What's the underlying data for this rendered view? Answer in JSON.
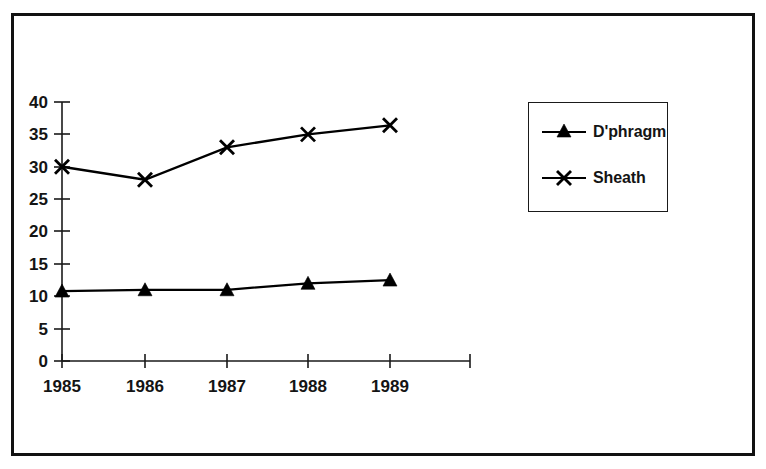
{
  "chart_data": {
    "type": "line",
    "title": "",
    "subtitle": "",
    "xlabel": "",
    "ylabel": "",
    "categories": [
      "1985",
      "1986",
      "1987",
      "1988",
      "1989"
    ],
    "x_tick_labels": [
      "1985",
      "1986",
      "1987",
      "1988",
      "1989"
    ],
    "y_tick_labels": [
      "0",
      "5",
      "10",
      "15",
      "20",
      "25",
      "30",
      "35",
      "40"
    ],
    "y_ticks": [
      0,
      5,
      10,
      15,
      20,
      25,
      30,
      35,
      40
    ],
    "ylim": [
      0,
      40
    ],
    "grid": false,
    "legend_position": "right",
    "series": [
      {
        "name": "D'phragm",
        "marker": "triangle",
        "color": "#000000",
        "values": [
          10.8,
          11.0,
          11.0,
          12.0,
          12.5
        ]
      },
      {
        "name": "Sheath",
        "marker": "x",
        "color": "#000000",
        "values": [
          30.0,
          28.0,
          33.0,
          35.0,
          36.4
        ]
      }
    ]
  },
  "legend": {
    "entries": [
      {
        "label": "D'phragm",
        "marker": "triangle-marker"
      },
      {
        "label": "Sheath",
        "marker": "x-marker"
      }
    ]
  },
  "colors": {
    "frame": "#111111",
    "axis": "#1a1a1a",
    "series": "#000000",
    "background": "#ffffff"
  }
}
